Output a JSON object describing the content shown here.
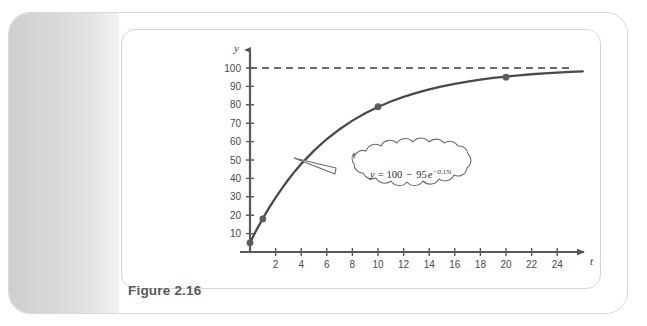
{
  "figure": {
    "caption": "Figure 2.16"
  },
  "chart_data": {
    "type": "line",
    "title": "",
    "xlabel": "t",
    "ylabel": "y",
    "equation": "y = 100 - 95e^(-0.15t)",
    "equation_parts": {
      "lhs": "y",
      "equals": "=",
      "constant": "100",
      "minus": "−",
      "coefficient": "95",
      "base": "e",
      "exponent": "−0.15t"
    },
    "xlim": [
      0,
      26
    ],
    "ylim": [
      0,
      108
    ],
    "xticks": [
      2,
      4,
      6,
      8,
      10,
      12,
      14,
      16,
      18,
      20,
      22,
      24
    ],
    "yticks": [
      10,
      20,
      30,
      40,
      50,
      60,
      70,
      80,
      90,
      100
    ],
    "grid": false,
    "legend": null,
    "asymptote": {
      "value": 100,
      "style": "dashed",
      "label": ""
    },
    "markers": [
      {
        "t": 0,
        "y": 5
      },
      {
        "t": 1,
        "y": 18
      },
      {
        "t": 10,
        "y": 79
      },
      {
        "t": 20,
        "y": 95
      }
    ],
    "series": [
      {
        "name": "y = 100 - 95e^(-0.15t)",
        "x": [
          0,
          0.5,
          1,
          1.5,
          2,
          2.5,
          3,
          3.5,
          4,
          5,
          6,
          7,
          8,
          9,
          10,
          11,
          12,
          13,
          14,
          15,
          16,
          17,
          18,
          19,
          20,
          21,
          22,
          23,
          24,
          25,
          26
        ],
        "values": [
          5.0,
          11.9,
          18.2,
          24.1,
          29.6,
          34.6,
          39.4,
          43.8,
          47.9,
          55.1,
          61.4,
          66.7,
          71.4,
          75.4,
          78.8,
          81.8,
          84.3,
          86.5,
          88.4,
          90.0,
          91.4,
          92.6,
          93.7,
          94.6,
          95.3,
          96.0,
          96.6,
          97.1,
          97.5,
          97.9,
          98.2
        ]
      }
    ],
    "colors": {
      "curve": "#4a4a4c",
      "marker": "#5c5c5e",
      "axis": "#58585a",
      "dashed": "#3c3c3e",
      "callout_fill": "#ffffff",
      "callout_stroke": "#6b6b6d"
    }
  }
}
